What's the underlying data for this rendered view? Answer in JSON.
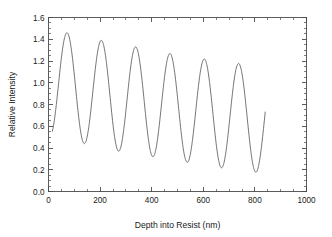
{
  "chart_data": {
    "type": "line",
    "title": "",
    "subtitle": "",
    "xlabel": "Depth into Resist (nm)",
    "ylabel": "Relative Intensity",
    "xlim": [
      0,
      1000
    ],
    "ylim": [
      0.0,
      1.6
    ],
    "grid": false,
    "legend": null,
    "legend_position": "none",
    "line_color": "#5a5a5a",
    "background_color": "#ffffff",
    "axis_color": "#4a4a4a",
    "x_ticks_major": [
      0,
      200,
      400,
      600,
      800,
      1000
    ],
    "x_tick_labels": [
      "0",
      "200",
      "400",
      "600",
      "800",
      "1000"
    ],
    "x_minor_tick_interval": 50,
    "y_ticks_major": [
      0.0,
      0.2,
      0.4,
      0.6,
      0.8,
      1.0,
      1.2,
      1.4,
      1.6
    ],
    "y_tick_labels": [
      "0.0",
      "0.2",
      "0.4",
      "0.6",
      "0.8",
      "1.0",
      "1.2",
      "1.4",
      "1.6"
    ],
    "y_minor_tick_interval": 0.05,
    "series": [
      {
        "name": "Standing wave intensity",
        "x_start": 15,
        "x_end": 840,
        "y_start": 0.52,
        "y_end": 0.94,
        "period_nm": 133,
        "first_peak_x": 72,
        "peaks": [
          {
            "x": 72,
            "y": 1.46
          },
          {
            "x": 205,
            "y": 1.39
          },
          {
            "x": 338,
            "y": 1.33
          },
          {
            "x": 468,
            "y": 1.27
          },
          {
            "x": 598,
            "y": 1.22
          },
          {
            "x": 728,
            "y": 1.18
          }
        ],
        "troughs": [
          {
            "x": 140,
            "y": 0.44
          },
          {
            "x": 272,
            "y": 0.37
          },
          {
            "x": 403,
            "y": 0.32
          },
          {
            "x": 533,
            "y": 0.27
          },
          {
            "x": 663,
            "y": 0.22
          },
          {
            "x": 793,
            "y": 0.18
          }
        ]
      }
    ]
  },
  "axes": {
    "x_title": "Depth into Resist (nm)",
    "y_title": "Relative Intensity"
  }
}
